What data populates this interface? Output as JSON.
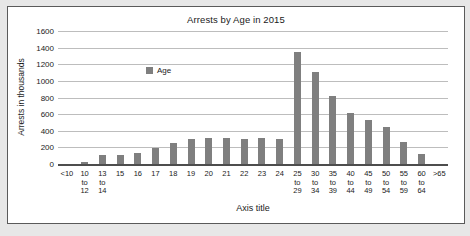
{
  "colors": {
    "bar": "#7f7f7f",
    "gridline": "#bdbdbd",
    "axis_line": "#4d4d4d",
    "frame_border": "#5a5a5a",
    "page_background": "#e7e7e7"
  },
  "chart_data": {
    "type": "bar",
    "title": "Arrests by Age in 2015",
    "xlabel": "Axis title",
    "ylabel": "Arrests in thousands",
    "legend": [
      "Age"
    ],
    "legend_position": "top-left-inside",
    "grid": true,
    "ylim": [
      0,
      1600
    ],
    "yticks": [
      0,
      200,
      400,
      600,
      800,
      1000,
      1200,
      1400,
      1600
    ],
    "categories": [
      "<10",
      "10 to 12",
      "13 to 14",
      "15",
      "16",
      "17",
      "18",
      "19",
      "20",
      "21",
      "22",
      "23",
      "24",
      "25 to 29",
      "30 to 34",
      "35 to 39",
      "40 to 44",
      "45 to 49",
      "50 to 54",
      "55 to 59",
      "60 to 64",
      ">65"
    ],
    "values": [
      0,
      40,
      125,
      115,
      145,
      200,
      265,
      310,
      325,
      330,
      310,
      320,
      310,
      1360,
      1120,
      830,
      625,
      540,
      460,
      280,
      135,
      0
    ]
  }
}
